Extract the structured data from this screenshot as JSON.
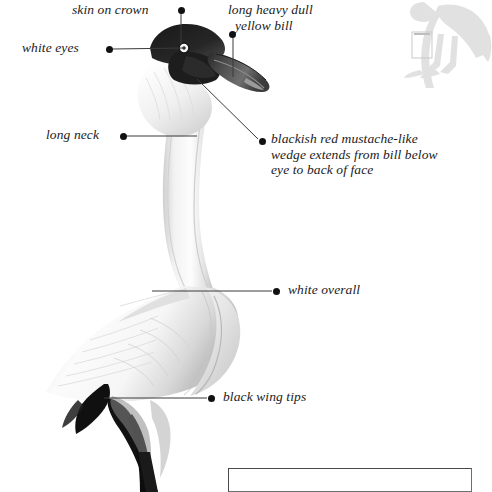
{
  "plate": {
    "subject": "wading-bird-anatomy-plate",
    "background_color": "#ffffff",
    "ink_color": "#1b1b1b",
    "leader_color": "#3a3a3a",
    "silhouette_color": "#b9b9b9"
  },
  "labels": [
    {
      "id": "skin-on-crown",
      "lines": [
        "skin on crown"
      ],
      "align": "right",
      "text_x": 72,
      "text_y": 2,
      "dot_x": 178,
      "dot_y": 7,
      "leader": [
        [
          181,
          13
        ],
        [
          181,
          44
        ]
      ]
    },
    {
      "id": "long-heavy-dull-yellow-bill",
      "lines": [
        "long heavy dull",
        "  yellow bill"
      ],
      "align": "left",
      "text_x": 228,
      "text_y": 2,
      "dot_x": 229,
      "dot_y": 31,
      "leader": [
        [
          233,
          38
        ],
        [
          233,
          77
        ]
      ]
    },
    {
      "id": "white-eyes",
      "lines": [
        "white eyes"
      ],
      "align": "right",
      "text_x": 22,
      "text_y": 40,
      "dot_x": 106,
      "dot_y": 46,
      "leader": [
        [
          113,
          49
        ],
        [
          184,
          48
        ]
      ]
    },
    {
      "id": "long-neck",
      "lines": [
        "long neck"
      ],
      "align": "right",
      "text_x": 46,
      "text_y": 127,
      "dot_x": 120,
      "dot_y": 133,
      "leader": [
        [
          127,
          136
        ],
        [
          197,
          136
        ]
      ]
    },
    {
      "id": "blackish-red-mustache",
      "lines": [
        "blackish red mustache-like",
        "wedge extends from bill below",
        "eye to back of face"
      ],
      "align": "left",
      "text_x": 271,
      "text_y": 131,
      "dot_x": 259,
      "dot_y": 138,
      "leader": [
        [
          258,
          139
        ],
        [
          197,
          79
        ]
      ]
    },
    {
      "id": "white-overall",
      "lines": [
        "white overall"
      ],
      "align": "left",
      "text_x": 288,
      "text_y": 282,
      "dot_x": 273,
      "dot_y": 288,
      "leader": [
        [
          272,
          291
        ],
        [
          152,
          291
        ]
      ]
    },
    {
      "id": "black-wing-tips",
      "lines": [
        "black wing tips"
      ],
      "align": "left",
      "text_x": 223,
      "text_y": 389,
      "dot_x": 208,
      "dot_y": 395,
      "leader": [
        [
          207,
          398
        ],
        [
          104,
          398
        ]
      ]
    }
  ],
  "silhouette": {
    "id": "standing-bird-silhouette",
    "x": 400,
    "y": 0,
    "width": 92,
    "height": 78,
    "marker_box": {
      "x": 412,
      "y": 32,
      "width": 20,
      "height": 26
    }
  },
  "caption_box": {
    "id": "empty-caption-frame",
    "x": 228,
    "y": 468,
    "width": 244,
    "height": 24,
    "text": ""
  }
}
